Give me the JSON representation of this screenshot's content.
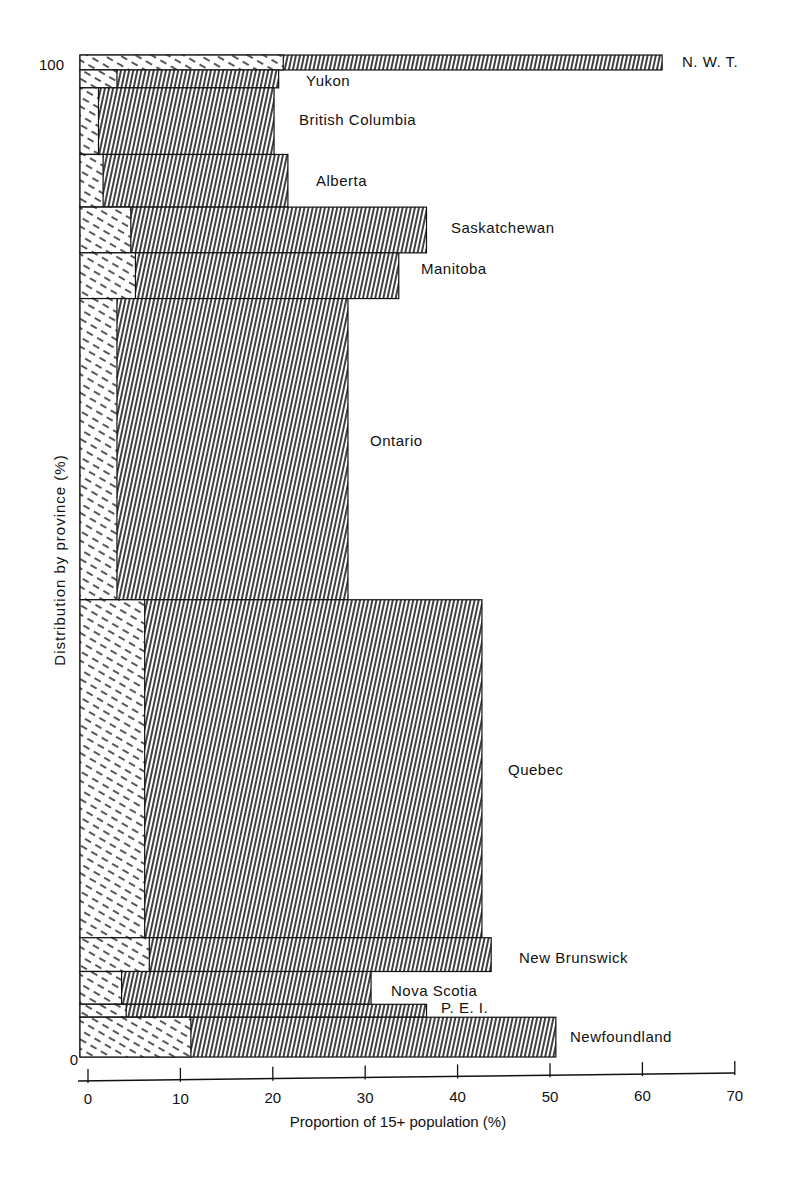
{
  "chart_data": {
    "type": "bar",
    "subtype": "variable-width stacked horizontal bar (mosaic)",
    "title": "",
    "xlabel": "Proportion of 15+ population (%)",
    "ylabel": "Distribution by province (%)",
    "xlim": [
      0,
      70
    ],
    "ylim": [
      0,
      100
    ],
    "x_ticks": [
      "0",
      "10",
      "20",
      "30",
      "40",
      "50",
      "60",
      "70"
    ],
    "y_ticks": [
      "0",
      "100"
    ],
    "grid": false,
    "legend": null,
    "series_note": "Each bar has a dashed-hatched inner segment and a fine vertical-hatched outer segment; bar height = share of distribution by province.",
    "categories": [
      "N. W. T.",
      "Yukon",
      "British Columbia",
      "Alberta",
      "Saskatchewan",
      "Manitoba",
      "Ontario",
      "Quebec",
      "New Brunswick",
      "Nova Scotia",
      "P. E. I.",
      "Newfoundland"
    ],
    "bars": [
      {
        "label": "N. W. T.",
        "y_top": 100.8,
        "y_bottom": 99.3,
        "inner": 22,
        "total": 63
      },
      {
        "label": "Yukon",
        "y_top": 99.3,
        "y_bottom": 97.5,
        "inner": 4,
        "total": 21.5
      },
      {
        "label": "British Columbia",
        "y_top": 97.5,
        "y_bottom": 90.8,
        "inner": 2,
        "total": 21
      },
      {
        "label": "Alberta",
        "y_top": 90.8,
        "y_bottom": 85.5,
        "inner": 2.5,
        "total": 22.5
      },
      {
        "label": "Saskatchewan",
        "y_top": 85.5,
        "y_bottom": 80.9,
        "inner": 5.5,
        "total": 37.5
      },
      {
        "label": "Manitoba",
        "y_top": 80.9,
        "y_bottom": 76.3,
        "inner": 6,
        "total": 34.5
      },
      {
        "label": "Ontario",
        "y_top": 76.3,
        "y_bottom": 46.0,
        "inner": 4,
        "total": 29
      },
      {
        "label": "Quebec",
        "y_top": 46.0,
        "y_bottom": 12.0,
        "inner": 7,
        "total": 43.5
      },
      {
        "label": "New Brunswick",
        "y_top": 12.0,
        "y_bottom": 8.6,
        "inner": 7.5,
        "total": 44.5
      },
      {
        "label": "Nova Scotia",
        "y_top": 8.6,
        "y_bottom": 5.3,
        "inner": 4.5,
        "total": 31.5
      },
      {
        "label": "P. E. I.",
        "y_top": 5.3,
        "y_bottom": 4.0,
        "inner": 5,
        "total": 37.5
      },
      {
        "label": "Newfoundland",
        "y_top": 4.0,
        "y_bottom": 0,
        "inner": 12,
        "total": 51.5
      }
    ],
    "label_positions": [
      {
        "label": "N. W. T.",
        "x": 682,
        "y": 67
      },
      {
        "label": "Yukon",
        "x": 306,
        "y": 86
      },
      {
        "label": "British Columbia",
        "x": 299,
        "y": 125
      },
      {
        "label": "Alberta",
        "x": 316,
        "y": 186
      },
      {
        "label": "Saskatchewan",
        "x": 451,
        "y": 233
      },
      {
        "label": "Manitoba",
        "x": 421,
        "y": 274
      },
      {
        "label": "Ontario",
        "x": 370,
        "y": 446
      },
      {
        "label": "Quebec",
        "x": 508,
        "y": 775
      },
      {
        "label": "New Brunswick",
        "x": 519,
        "y": 963
      },
      {
        "label": "Nova Scotia",
        "x": 391,
        "y": 996
      },
      {
        "label": "P. E. I.",
        "x": 441,
        "y": 1013
      },
      {
        "label": "Newfoundland",
        "x": 570,
        "y": 1042
      }
    ]
  },
  "axes": {
    "x_title": "Proportion of 15+ population (%)",
    "y_title": "Distribution by province (%)",
    "x_ticks": [
      "0",
      "10",
      "20",
      "30",
      "40",
      "50",
      "60",
      "70"
    ],
    "y_tick_top": "100",
    "y_tick_bottom": "0"
  }
}
